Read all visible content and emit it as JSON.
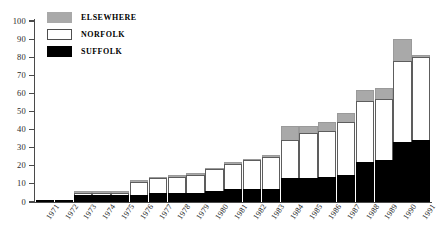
{
  "chart_data": {
    "type": "bar",
    "stacked": true,
    "title": "",
    "xlabel": "",
    "ylabel": "",
    "ylim": [
      0,
      100
    ],
    "ytick_step": 10,
    "grid": false,
    "legend_position": "top-left",
    "categories": [
      "1971",
      "1972",
      "1973",
      "1974",
      "1975",
      "1976",
      "1977",
      "1978",
      "1979",
      "1980",
      "1981",
      "1982",
      "1983",
      "1984",
      "1985",
      "1986",
      "1987",
      "1988",
      "1989",
      "1990",
      "1991"
    ],
    "yticks": [
      "0",
      "10",
      "20",
      "30",
      "40",
      "50",
      "60",
      "70",
      "80",
      "90",
      "100"
    ],
    "series": [
      {
        "name": "SUFFOLK",
        "color": "#000000",
        "values": [
          1,
          1,
          4,
          4,
          4,
          4,
          5,
          5,
          5,
          6,
          7,
          7,
          7,
          13,
          13,
          14,
          15,
          22,
          23,
          33,
          34
        ]
      },
      {
        "name": "NORFOLK",
        "color": "#ffffff",
        "values": [
          0,
          0,
          1,
          1,
          1,
          7,
          8,
          9,
          10,
          12,
          14,
          16,
          18,
          21,
          25,
          25,
          29,
          34,
          34,
          45,
          46
        ]
      },
      {
        "name": "ELSEWHERE",
        "color": "#a9a9a9",
        "values": [
          0,
          0,
          1,
          1,
          1,
          1,
          1,
          1,
          1,
          1,
          1,
          1,
          1,
          8,
          4,
          5,
          5,
          6,
          6,
          12,
          1
        ]
      }
    ],
    "totals": [
      1,
      1,
      6,
      6,
      6,
      12,
      14,
      15,
      16,
      19,
      22,
      24,
      26,
      42,
      42,
      44,
      49,
      62,
      63,
      90,
      81
    ]
  },
  "legend": {
    "items": [
      {
        "label": "ELSEWHERE",
        "key": "elsewhere"
      },
      {
        "label": "NORFOLK",
        "key": "norfolk"
      },
      {
        "label": "SUFFOLK",
        "key": "suffolk"
      }
    ]
  }
}
